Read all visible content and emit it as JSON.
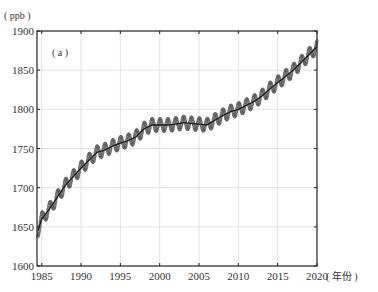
{
  "chart_data": {
    "type": "line",
    "title": "",
    "panel_label": "( a )",
    "ylabel": "( ppb )",
    "xlabel": "( 年份 )",
    "xlim": [
      1984.4,
      2020
    ],
    "ylim": [
      1600,
      1900
    ],
    "xticks": [
      1985,
      1990,
      1995,
      2000,
      2005,
      2010,
      2015,
      2020
    ],
    "yticks": [
      1600,
      1650,
      1700,
      1750,
      1800,
      1850,
      1900
    ],
    "grid": true,
    "legend": null,
    "seasonal_amplitude_ppb": 8,
    "series": [
      {
        "name": "trend (annual)",
        "style": "solid dark line with monthly seasonal-cycle markers",
        "x": [
          1984.5,
          1985,
          1986,
          1987,
          1988,
          1989,
          1990,
          1991,
          1992,
          1993,
          1994,
          1995,
          1996,
          1997,
          1998,
          1999,
          2000,
          2001,
          2002,
          2003,
          2004,
          2005,
          2006,
          2007,
          2008,
          2009,
          2010,
          2011,
          2012,
          2013,
          2014,
          2015,
          2016,
          2017,
          2018,
          2019,
          2020
        ],
        "values": [
          1645,
          1660,
          1673,
          1688,
          1703,
          1714,
          1725,
          1735,
          1745,
          1748,
          1753,
          1757,
          1760,
          1765,
          1775,
          1780,
          1780,
          1780,
          1781,
          1783,
          1782,
          1781,
          1780,
          1786,
          1792,
          1797,
          1800,
          1805,
          1810,
          1817,
          1826,
          1834,
          1842,
          1850,
          1860,
          1870,
          1880
        ]
      }
    ]
  }
}
